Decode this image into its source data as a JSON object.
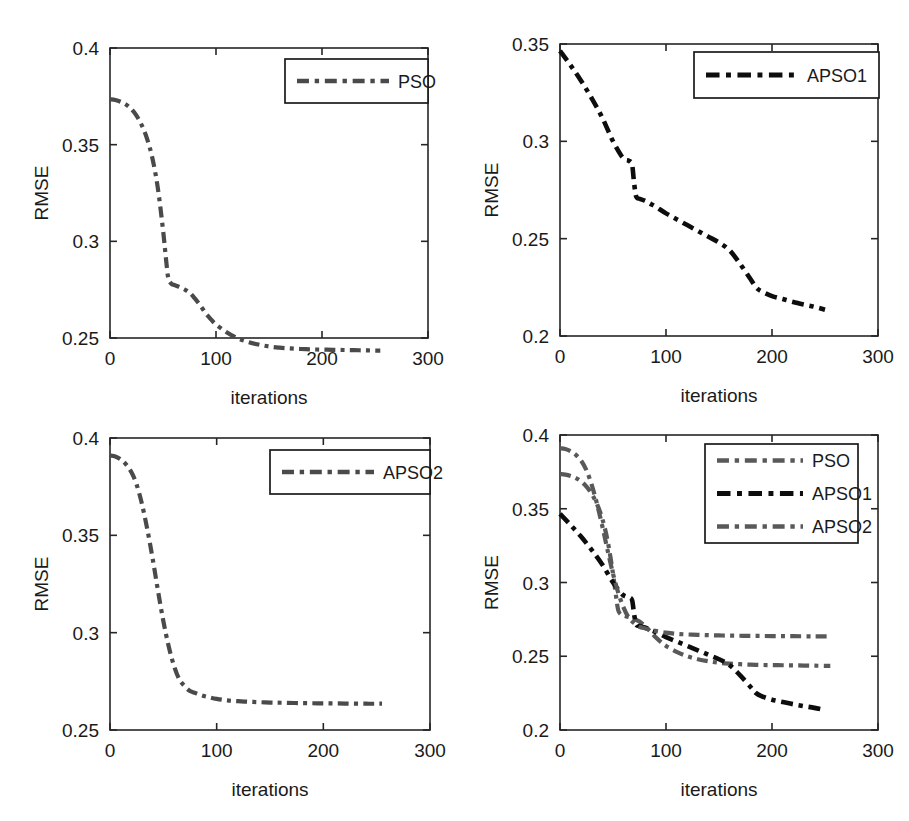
{
  "figure": {
    "background": "#ffffff",
    "width": 909,
    "height": 821,
    "panel_count": 4
  },
  "colors": {
    "pso": "#4a4a4a",
    "apso1": "#0d0d0d",
    "apso2": "#595959",
    "axis": "#262626",
    "text": "#1a1a1a"
  },
  "labels": {
    "ylabel": "RMSE",
    "xlabel": "iterations",
    "pso": "PSO",
    "apso1": "APSO1",
    "apso2": "APSO2"
  },
  "panels": [
    {
      "id": "panel-top-left",
      "xlabel": "iterations",
      "ylabel": "RMSE",
      "xticks": [
        "0",
        "100",
        "200",
        "300"
      ],
      "yticks": [
        "0.25",
        "0.3",
        "0.35",
        "0.4"
      ],
      "legend": [
        "PSO"
      ]
    },
    {
      "id": "panel-top-right",
      "xlabel": "iterations",
      "ylabel": "RMSE",
      "xticks": [
        "0",
        "100",
        "200",
        "300"
      ],
      "yticks": [
        "0.2",
        "0.25",
        "0.3",
        "0.35"
      ],
      "legend": [
        "APSO1"
      ]
    },
    {
      "id": "panel-bottom-left",
      "xlabel": "iterations",
      "ylabel": "RMSE",
      "xticks": [
        "0",
        "100",
        "200",
        "300"
      ],
      "yticks": [
        "0.25",
        "0.3",
        "0.35",
        "0.4"
      ],
      "legend": [
        "APSO2"
      ]
    },
    {
      "id": "panel-bottom-right",
      "xlabel": "iterations",
      "ylabel": "RMSE",
      "xticks": [
        "0",
        "100",
        "200",
        "300"
      ],
      "yticks": [
        "0.2",
        "0.25",
        "0.3",
        "0.35",
        "0.4"
      ],
      "legend": [
        "PSO",
        "APSO1",
        "APSO2"
      ]
    }
  ],
  "chart_data": [
    {
      "type": "line",
      "title": "",
      "xlabel": "iterations",
      "ylabel": "RMSE",
      "xlim": [
        0,
        300
      ],
      "ylim": [
        0.25,
        0.4
      ],
      "xticks": [
        0,
        100,
        200,
        300
      ],
      "yticks": [
        0.25,
        0.3,
        0.35,
        0.4
      ],
      "grid": false,
      "legend_position": "top-right",
      "series": [
        {
          "name": "PSO",
          "color": "#4a4a4a",
          "linestyle": "dashdot",
          "x": [
            0,
            5,
            10,
            15,
            20,
            25,
            30,
            35,
            40,
            45,
            50,
            53,
            55,
            58,
            60,
            65,
            70,
            75,
            80,
            85,
            90,
            95,
            100,
            110,
            120,
            130,
            140,
            150,
            160,
            170,
            180,
            190,
            200,
            210,
            220,
            230,
            240,
            250,
            255
          ],
          "y": [
            0.3735,
            0.3731,
            0.3722,
            0.3708,
            0.3685,
            0.365,
            0.36,
            0.353,
            0.343,
            0.328,
            0.306,
            0.29,
            0.281,
            0.278,
            0.2775,
            0.2765,
            0.2752,
            0.2735,
            0.2705,
            0.267,
            0.263,
            0.2598,
            0.257,
            0.253,
            0.25,
            0.248,
            0.2466,
            0.2456,
            0.245,
            0.2446,
            0.2443,
            0.2441,
            0.244,
            0.2439,
            0.2438,
            0.2437,
            0.2436,
            0.2435,
            0.2435
          ]
        }
      ]
    },
    {
      "type": "line",
      "title": "",
      "xlabel": "iterations",
      "ylabel": "RMSE",
      "xlim": [
        0,
        300
      ],
      "ylim": [
        0.2,
        0.35
      ],
      "xticks": [
        0,
        100,
        200,
        300
      ],
      "yticks": [
        0.2,
        0.25,
        0.3,
        0.35
      ],
      "grid": false,
      "legend_position": "top-right",
      "series": [
        {
          "name": "APSO1",
          "color": "#0d0d0d",
          "linestyle": "dashdot",
          "x": [
            0,
            10,
            20,
            30,
            40,
            50,
            58,
            62,
            65,
            68,
            70,
            72,
            75,
            80,
            85,
            90,
            100,
            110,
            120,
            130,
            140,
            150,
            160,
            170,
            180,
            185,
            190,
            200,
            210,
            220,
            230,
            240,
            250
          ],
          "y": [
            0.3465,
            0.339,
            0.331,
            0.322,
            0.312,
            0.3,
            0.2925,
            0.2905,
            0.29,
            0.288,
            0.278,
            0.2715,
            0.2705,
            0.2695,
            0.268,
            0.2665,
            0.263,
            0.26,
            0.257,
            0.254,
            0.251,
            0.248,
            0.244,
            0.237,
            0.229,
            0.225,
            0.223,
            0.2205,
            0.219,
            0.2175,
            0.2162,
            0.215,
            0.2135
          ]
        }
      ]
    },
    {
      "type": "line",
      "title": "",
      "xlabel": "iterations",
      "ylabel": "RMSE",
      "xlim": [
        0,
        300
      ],
      "ylim": [
        0.25,
        0.4
      ],
      "xticks": [
        0,
        100,
        200,
        300
      ],
      "yticks": [
        0.25,
        0.3,
        0.35,
        0.4
      ],
      "grid": false,
      "legend_position": "top-right",
      "series": [
        {
          "name": "APSO2",
          "color": "#4a4a4a",
          "linestyle": "dashdot",
          "x": [
            0,
            5,
            10,
            15,
            20,
            25,
            30,
            35,
            40,
            45,
            50,
            55,
            60,
            65,
            70,
            75,
            80,
            85,
            90,
            100,
            110,
            120,
            130,
            140,
            150,
            160,
            180,
            200,
            220,
            240,
            255
          ],
          "y": [
            0.391,
            0.3905,
            0.389,
            0.3865,
            0.3825,
            0.376,
            0.366,
            0.353,
            0.338,
            0.3215,
            0.306,
            0.293,
            0.283,
            0.276,
            0.2725,
            0.27,
            0.269,
            0.268,
            0.2672,
            0.266,
            0.2652,
            0.2648,
            0.2645,
            0.2643,
            0.2641,
            0.264,
            0.2638,
            0.2637,
            0.2636,
            0.2635,
            0.2635
          ]
        }
      ]
    },
    {
      "type": "line",
      "title": "",
      "xlabel": "iterations",
      "ylabel": "RMSE",
      "xlim": [
        0,
        300
      ],
      "ylim": [
        0.2,
        0.4
      ],
      "xticks": [
        0,
        100,
        200,
        300
      ],
      "yticks": [
        0.2,
        0.25,
        0.3,
        0.35,
        0.4
      ],
      "grid": false,
      "legend_position": "top-right",
      "series": [
        {
          "name": "PSO",
          "color": "#595959",
          "linestyle": "dashdot",
          "x": [
            0,
            5,
            10,
            15,
            20,
            25,
            30,
            35,
            40,
            45,
            50,
            53,
            55,
            58,
            60,
            65,
            70,
            75,
            80,
            85,
            90,
            95,
            100,
            110,
            120,
            130,
            140,
            150,
            160,
            170,
            180,
            190,
            200,
            210,
            220,
            230,
            240,
            250,
            255
          ],
          "y": [
            0.3735,
            0.3731,
            0.3722,
            0.3708,
            0.3685,
            0.365,
            0.36,
            0.353,
            0.343,
            0.328,
            0.306,
            0.29,
            0.281,
            0.278,
            0.2775,
            0.2765,
            0.2752,
            0.2735,
            0.2705,
            0.267,
            0.263,
            0.2598,
            0.257,
            0.253,
            0.25,
            0.248,
            0.2466,
            0.2456,
            0.245,
            0.2446,
            0.2443,
            0.2441,
            0.244,
            0.2439,
            0.2438,
            0.2437,
            0.2436,
            0.2435,
            0.2435
          ]
        },
        {
          "name": "APSO1",
          "color": "#0d0d0d",
          "linestyle": "dashdot",
          "x": [
            0,
            10,
            20,
            30,
            40,
            50,
            58,
            62,
            65,
            68,
            70,
            72,
            75,
            80,
            85,
            90,
            100,
            110,
            120,
            130,
            140,
            150,
            160,
            170,
            180,
            185,
            190,
            200,
            210,
            220,
            230,
            240,
            250
          ],
          "y": [
            0.3465,
            0.339,
            0.331,
            0.322,
            0.312,
            0.3,
            0.2925,
            0.2905,
            0.29,
            0.288,
            0.278,
            0.2715,
            0.2705,
            0.2695,
            0.268,
            0.2665,
            0.263,
            0.26,
            0.257,
            0.254,
            0.251,
            0.248,
            0.244,
            0.237,
            0.229,
            0.225,
            0.223,
            0.2205,
            0.219,
            0.2175,
            0.2162,
            0.215,
            0.2135
          ]
        },
        {
          "name": "APSO2",
          "color": "#595959",
          "linestyle": "dashdot",
          "x": [
            0,
            5,
            10,
            15,
            20,
            25,
            30,
            35,
            40,
            45,
            50,
            55,
            60,
            65,
            70,
            75,
            80,
            85,
            90,
            100,
            110,
            120,
            130,
            140,
            150,
            160,
            180,
            200,
            220,
            240,
            255
          ],
          "y": [
            0.391,
            0.3905,
            0.389,
            0.3865,
            0.3825,
            0.376,
            0.366,
            0.353,
            0.338,
            0.3215,
            0.306,
            0.293,
            0.283,
            0.276,
            0.2725,
            0.27,
            0.269,
            0.268,
            0.2672,
            0.266,
            0.2652,
            0.2648,
            0.2645,
            0.2643,
            0.2641,
            0.264,
            0.2638,
            0.2637,
            0.2636,
            0.2635,
            0.2635
          ]
        }
      ]
    }
  ]
}
